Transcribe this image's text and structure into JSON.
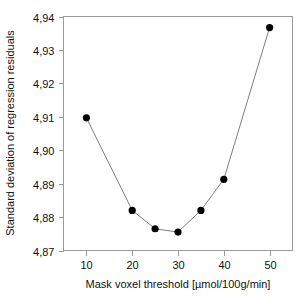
{
  "chart_data": {
    "type": "line",
    "title": "",
    "subtitle": "",
    "xlabel": "Mask voxel threshold [µmol/100g/min]",
    "ylabel": "Standard deviation of regression residuals",
    "x": [
      10,
      20,
      25,
      30,
      35,
      40,
      50
    ],
    "values": [
      4.9097,
      4.882,
      4.8765,
      4.8755,
      4.882,
      4.8913,
      4.9367
    ],
    "series": [
      {
        "name": "Standard deviation of regression residuals",
        "x": [
          10,
          20,
          25,
          30,
          35,
          40,
          50
        ],
        "values": [
          4.9097,
          4.882,
          4.8765,
          4.8755,
          4.882,
          4.8913,
          4.9367
        ]
      }
    ],
    "xlim": [
      5,
      55
    ],
    "ylim": [
      4.87,
      4.94
    ],
    "xticks": [
      10,
      20,
      30,
      40,
      50
    ],
    "yticks": [
      4.87,
      4.88,
      4.89,
      4.9,
      4.91,
      4.92,
      4.93,
      4.94
    ],
    "xticklabels": [
      "10",
      "20",
      "30",
      "40",
      "50"
    ],
    "yticklabels": [
      "4,87",
      "4,88",
      "4,89",
      "4,90",
      "4,91",
      "4,92",
      "4,93",
      "4,94"
    ],
    "decimal_separator": ",",
    "grid": false,
    "legend": false,
    "legend_position": "none",
    "marker": "filled-circle",
    "marker_color": "#000000",
    "line_color": "#7d7d7d",
    "frame_color": "#9a9a9a",
    "background_color": "#ffffff",
    "annotations": []
  },
  "axes": {
    "x": {
      "label": "Mask voxel threshold [µmol/100g/min]",
      "tick_labels": [
        "10",
        "20",
        "30",
        "40",
        "50"
      ]
    },
    "y": {
      "label": "Standard deviation of regression residuals",
      "tick_labels": [
        "4,87",
        "4,88",
        "4,89",
        "4,90",
        "4,91",
        "4,92",
        "4,93",
        "4,94"
      ]
    }
  }
}
